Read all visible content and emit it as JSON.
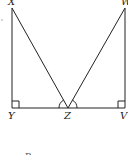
{
  "diagram": {
    "points": {
      "X": {
        "label": "X",
        "x": 12,
        "y": 8
      },
      "W": {
        "label": "W",
        "x": 125,
        "y": 8
      },
      "Y": {
        "label": "Y",
        "x": 12,
        "y": 108
      },
      "Z": {
        "label": "Z",
        "x": 68,
        "y": 108
      },
      "V": {
        "label": "V",
        "x": 125,
        "y": 108
      }
    },
    "segments": [
      "XY",
      "WV",
      "YV",
      "XZ",
      "WZ"
    ],
    "right_angles": [
      "Y",
      "V"
    ],
    "angle_arcs_at": "Z",
    "footer_label": "B",
    "colors": {
      "stroke": "#222222",
      "background": "#ffffff"
    }
  }
}
